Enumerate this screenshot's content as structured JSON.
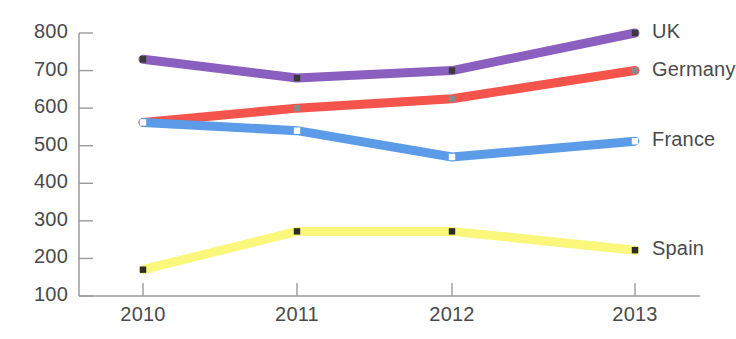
{
  "chart_data": {
    "type": "line",
    "title": "",
    "xlabel": "",
    "ylabel": "",
    "categories": [
      "2010",
      "2011",
      "2012",
      "2013"
    ],
    "x": [
      2010,
      2011,
      2012,
      2013
    ],
    "ylim": [
      100,
      800
    ],
    "yticks": [
      100,
      200,
      300,
      400,
      500,
      600,
      700,
      800
    ],
    "ytick_labels": [
      "100",
      "200",
      "300",
      "400",
      "500",
      "600",
      "700",
      "800"
    ],
    "grid": false,
    "legend_position": "right-inline-end-of-line",
    "markers": "square",
    "series": [
      {
        "name": "UK",
        "color": "#8B5FBF",
        "marker_color": "#3a3a3a",
        "values": [
          730,
          680,
          700,
          800
        ]
      },
      {
        "name": "Germany",
        "color": "#F4544C",
        "marker_color": "#8a8a8a",
        "values": [
          562,
          600,
          625,
          700
        ]
      },
      {
        "name": "France",
        "color": "#5B9BE8",
        "marker_color": "#ffffff",
        "values": [
          562,
          540,
          470,
          512
        ]
      },
      {
        "name": "Spain",
        "color": "#FAF77A",
        "marker_color": "#2b2b2b",
        "values": [
          170,
          272,
          272,
          222
        ]
      }
    ]
  },
  "axis": {
    "line_color": "#9a9a9a",
    "tick_color": "#9a9a9a"
  }
}
